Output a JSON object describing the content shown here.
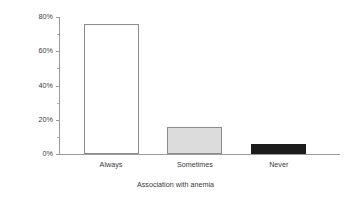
{
  "chart_data": {
    "type": "bar",
    "title": "",
    "subtitle": "",
    "xlabel": "Association with anemia",
    "ylabel": "Proportion of reports",
    "categories": [
      "Always",
      "Sometimes",
      "Never"
    ],
    "values": [
      76,
      16,
      6
    ],
    "value_labels": [
      "76%",
      "16%",
      "6%"
    ],
    "series": [
      {
        "name": "Proportion of reports",
        "values": [
          76,
          16,
          6
        ]
      }
    ],
    "ylim": [
      0,
      80
    ],
    "yticks": [
      0,
      20,
      40,
      60,
      80
    ],
    "ytick_labels": [
      "0%",
      "20%",
      "40%",
      "60%",
      "80%"
    ],
    "yminor_ticks": [
      10,
      30,
      50,
      70
    ],
    "grid": false,
    "legend": false,
    "legend_position": "none",
    "bar_styles": [
      {
        "category": "Always",
        "fill": "#ffffff",
        "edge": "#8c8c8c"
      },
      {
        "category": "Sometimes",
        "fill": "#dcdcdc",
        "edge": "#8c8c8c"
      },
      {
        "category": "Never",
        "fill": "#1c1c1c",
        "edge": "#1c1c1c"
      }
    ],
    "axis_color": "#9a9a9a",
    "text_color": "#3a3a3a",
    "background": "#ffffff"
  }
}
